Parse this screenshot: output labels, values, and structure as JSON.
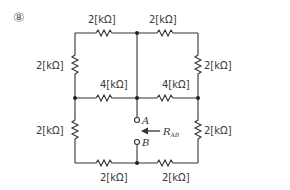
{
  "problem_number": "⑧",
  "resistors": {
    "top_left": "2[kΩ]",
    "top_right": "2[kΩ]",
    "left_upper": "2[kΩ]",
    "right_upper": "2[kΩ]",
    "middle_left": "4[kΩ]",
    "middle_right": "4[kΩ]",
    "left_lower": "2[kΩ]",
    "right_lower": "2[kΩ]",
    "bottom_left": "2[kΩ]",
    "bottom_right": "2[kΩ]"
  },
  "terminals": {
    "a": "A",
    "b": "B"
  },
  "measurement": {
    "r": "R",
    "sub": "AB"
  },
  "colors": {
    "wire": "#333333",
    "text": "#3a3a3a"
  }
}
